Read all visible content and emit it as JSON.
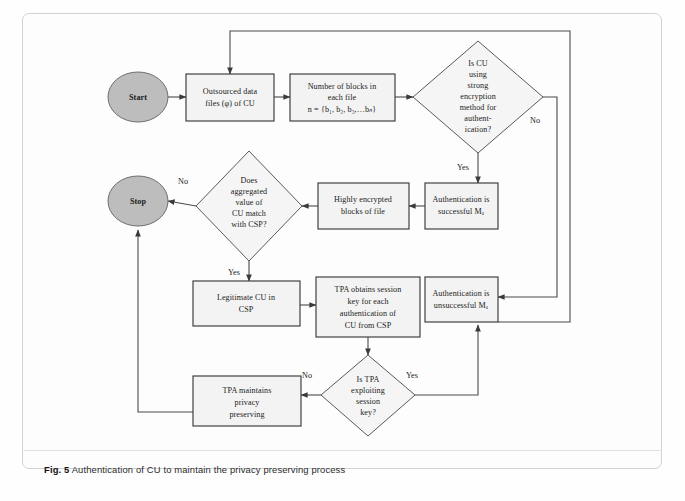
{
  "figure": {
    "caption_number": "Fig. 5",
    "caption_text": "Authentication of CU to maintain the privacy preserving process"
  },
  "diagram": {
    "type": "flowchart",
    "title": "Authentication of CU to maintain the privacy preserving process",
    "nodes": [
      {
        "id": "start",
        "shape": "terminator",
        "lines": [
          "Start"
        ]
      },
      {
        "id": "outsourced",
        "shape": "process",
        "lines": [
          "Outsourced data",
          "files (φ) of CU"
        ]
      },
      {
        "id": "blocks",
        "shape": "process",
        "lines": [
          "Number of blocks in",
          "each file",
          "n = {b₁, b₂, b₃,…bₙ}"
        ]
      },
      {
        "id": "is_strong",
        "shape": "decision",
        "lines": [
          "Is CU",
          "using",
          "strong",
          "encryption",
          "method for",
          "authent-",
          "ication?"
        ]
      },
      {
        "id": "auth_ok",
        "shape": "process",
        "lines": [
          "Authentication is",
          "successful Mₐ"
        ]
      },
      {
        "id": "highly_enc",
        "shape": "process",
        "lines": [
          "Highly encrypted",
          "blocks of file"
        ]
      },
      {
        "id": "aggregated",
        "shape": "decision",
        "lines": [
          "Does",
          "aggregated",
          "value of",
          "CU match",
          "with CSP?"
        ]
      },
      {
        "id": "stop",
        "shape": "terminator",
        "lines": [
          "Stop"
        ]
      },
      {
        "id": "legit",
        "shape": "process",
        "lines": [
          "Legitimate CU in",
          "CSP"
        ]
      },
      {
        "id": "tpa_session",
        "shape": "process",
        "lines": [
          "TPA obtains session",
          "key for each",
          "authentication of",
          "CU from CSP"
        ]
      },
      {
        "id": "auth_fail",
        "shape": "process",
        "lines": [
          "Authentication is",
          "unsuccessful Mₐ"
        ]
      },
      {
        "id": "is_exploit",
        "shape": "decision",
        "lines": [
          "Is TPA",
          "exploiting",
          "session",
          "key?"
        ]
      },
      {
        "id": "tpa_privacy",
        "shape": "process",
        "lines": [
          "TPA maintains",
          "privacy",
          "preserving"
        ]
      }
    ],
    "edge_labels": {
      "strong_yes": "Yes",
      "strong_no": "No",
      "aggregated_no": "No",
      "aggregated_yes": "Yes",
      "exploit_no": "No",
      "exploit_yes": "Yes"
    },
    "edges": [
      {
        "from": "start",
        "to": "outsourced",
        "label": ""
      },
      {
        "from": "outsourced",
        "to": "blocks",
        "label": ""
      },
      {
        "from": "blocks",
        "to": "is_strong",
        "label": ""
      },
      {
        "from": "is_strong",
        "to": "auth_ok",
        "label": "Yes"
      },
      {
        "from": "is_strong",
        "to": "auth_fail",
        "label": "No"
      },
      {
        "from": "auth_ok",
        "to": "highly_enc",
        "label": ""
      },
      {
        "from": "highly_enc",
        "to": "aggregated",
        "label": ""
      },
      {
        "from": "aggregated",
        "to": "stop",
        "label": "No"
      },
      {
        "from": "aggregated",
        "to": "legit",
        "label": "Yes"
      },
      {
        "from": "legit",
        "to": "tpa_session",
        "label": ""
      },
      {
        "from": "tpa_session",
        "to": "is_exploit",
        "label": ""
      },
      {
        "from": "is_exploit",
        "to": "tpa_privacy",
        "label": "No"
      },
      {
        "from": "is_exploit",
        "to": "auth_fail",
        "label": "Yes"
      },
      {
        "from": "tpa_privacy",
        "to": "stop",
        "label": ""
      },
      {
        "from": "auth_fail",
        "to": "outsourced",
        "label": ""
      }
    ],
    "colors": {
      "terminator_fill": "#bdbdbd",
      "box_fill": "#f3f3f3",
      "diamond_fill": "#f5f5f5",
      "stroke": "#4a4a4a",
      "text": "#1a1a1a"
    }
  }
}
